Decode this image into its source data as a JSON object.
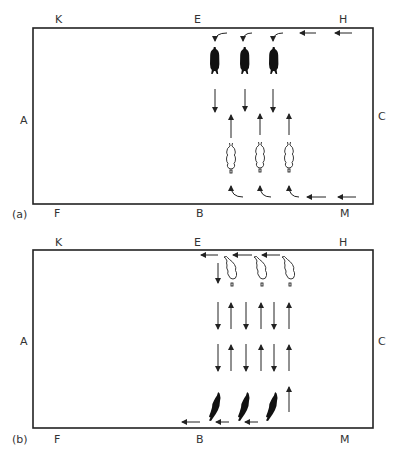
{
  "panels": [
    {
      "id": "a",
      "caption": "(a)",
      "markers": {
        "top_left": "K",
        "top_mid": "E",
        "top_right": "H",
        "left": "A",
        "right": "C",
        "bottom_left": "F",
        "bottom_mid": "B",
        "bottom_right": "M"
      },
      "description": "Three dark riders (entering from H along the long side, turning at E) travel down toward centre; three light riders (entering from M, turning at B) travel up toward centre."
    },
    {
      "id": "b",
      "caption": "(b)",
      "markers": {
        "top_left": "K",
        "top_mid": "E",
        "top_right": "H",
        "left": "A",
        "right": "C",
        "bottom_left": "F",
        "bottom_mid": "B",
        "bottom_right": "M"
      },
      "description": "Light riders at E side, dark riders at B side, alternating up/down arrows between them and exit arrows leftward."
    }
  ]
}
